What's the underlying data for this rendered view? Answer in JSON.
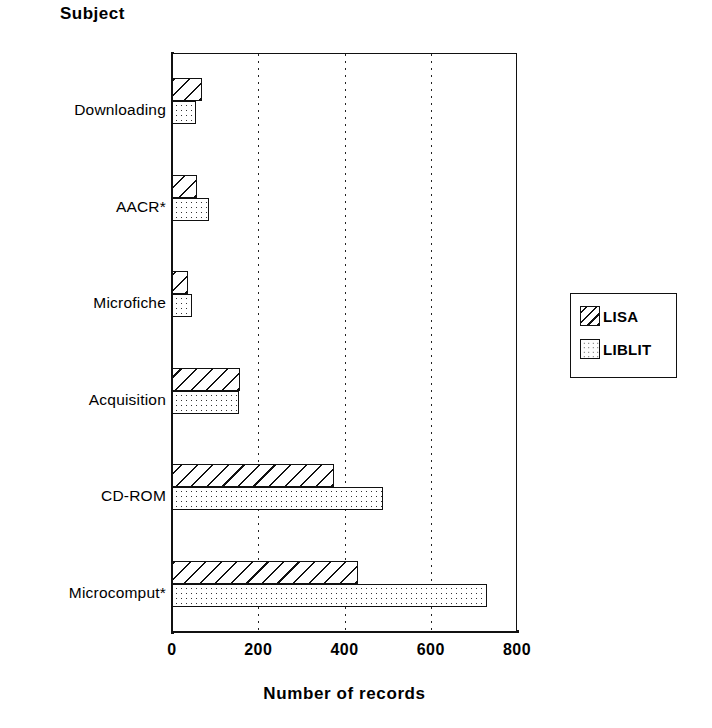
{
  "chart_data": {
    "type": "bar",
    "orientation": "horizontal",
    "title": "Subject",
    "xlabel": "Number of records",
    "ylabel": "Subject",
    "xlim": [
      0,
      800
    ],
    "xticks": [
      0,
      200,
      400,
      600,
      800
    ],
    "grid": "vertical dotted gridlines at 200, 400, 600",
    "legend_position": "right",
    "categories": [
      "Downloading",
      "AACR*",
      "Microfiche",
      "Acquisition",
      "CD-ROM",
      "Microcomput*"
    ],
    "series": [
      {
        "name": "LISA",
        "pattern": "diagonal-hatch",
        "values": [
          70,
          58,
          38,
          158,
          375,
          432
        ]
      },
      {
        "name": "LIBLIT",
        "pattern": "dotted-fill",
        "values": [
          56,
          86,
          47,
          155,
          490,
          730
        ]
      }
    ]
  },
  "title": {
    "text": "Subject"
  },
  "axis": {
    "x_title": "Number of records",
    "x_ticks": [
      "0",
      "200",
      "400",
      "600",
      "800"
    ]
  },
  "categories": [
    {
      "label": "Downloading"
    },
    {
      "label": "AACR*"
    },
    {
      "label": "Microfiche"
    },
    {
      "label": "Acquisition"
    },
    {
      "label": "CD-ROM"
    },
    {
      "label": "Microcomput*"
    }
  ],
  "legend": {
    "entries": [
      {
        "label": "LISA",
        "swatch": "diagonal-hatch-swatch"
      },
      {
        "label": "LIBLIT",
        "swatch": "dotted-fill-swatch"
      }
    ]
  },
  "colors": {
    "ink": "#111111",
    "background": "#ffffff"
  }
}
